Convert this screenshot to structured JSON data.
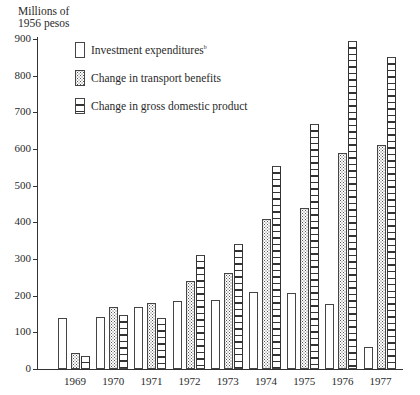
{
  "chart_data": {
    "type": "bar",
    "title": "",
    "ylabel": "Millions of 1956 pesos",
    "xlabel": "",
    "ylim": [
      0,
      900
    ],
    "yticks": [
      0,
      100,
      200,
      300,
      400,
      500,
      600,
      700,
      800,
      900
    ],
    "grid": false,
    "legend_position": "upper left",
    "categories": [
      "1969",
      "1970",
      "1971",
      "1972",
      "1973",
      "1974",
      "1975",
      "1976",
      "1977"
    ],
    "series": [
      {
        "name": "Investment expenditures",
        "footnote": "b",
        "pattern": "blank",
        "values": [
          138,
          142,
          168,
          185,
          188,
          210,
          207,
          177,
          60
        ]
      },
      {
        "name": "Change in transport benefits",
        "pattern": "dotted",
        "values": [
          45,
          168,
          180,
          240,
          262,
          408,
          440,
          590,
          612
        ]
      },
      {
        "name": "Change in gross domestic product",
        "pattern": "horizontal-lines",
        "values": [
          35,
          148,
          140,
          312,
          340,
          553,
          668,
          895,
          850
        ]
      }
    ]
  },
  "axis": {
    "ylabel_line1": "Millions of",
    "ylabel_line2": "1956 pesos"
  },
  "legend": {
    "items": [
      {
        "label": "Investment expenditures",
        "sup": "b"
      },
      {
        "label": "Change in transport benefits",
        "sup": ""
      },
      {
        "label": "Change in gross domestic product",
        "sup": ""
      }
    ]
  }
}
